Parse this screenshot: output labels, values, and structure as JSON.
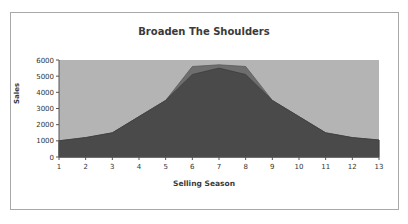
{
  "chart_data": {
    "type": "area",
    "title": "Broaden The Shoulders",
    "xlabel": "Selling Season",
    "ylabel": "Sales",
    "x": [
      1,
      2,
      3,
      4,
      5,
      6,
      7,
      8,
      9,
      10,
      11,
      12,
      13
    ],
    "ylim": [
      0,
      6000
    ],
    "yticks": [
      0,
      1000,
      2000,
      3000,
      4000,
      5000,
      6000
    ],
    "grid": false,
    "legend": "none",
    "series": [
      {
        "name": "Broadened",
        "values": [
          1000,
          1200,
          1500,
          2500,
          3500,
          5600,
          5700,
          5600,
          3500,
          2500,
          1500,
          1200,
          1050
        ],
        "color": "#6e6e6e"
      },
      {
        "name": "Base",
        "values": [
          1000,
          1200,
          1500,
          2500,
          3500,
          5100,
          5500,
          5100,
          3500,
          2500,
          1500,
          1200,
          1050
        ],
        "color": "#4a4a4a"
      }
    ],
    "plot_background": "#b4b4b4"
  }
}
